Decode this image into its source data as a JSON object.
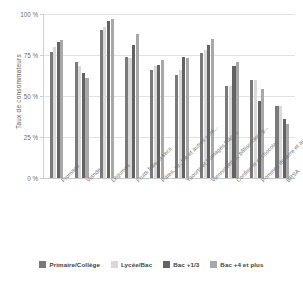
{
  "chart_data": {
    "type": "bar",
    "title": "",
    "xlabel": "",
    "ylabel": "Taux de consommateurs",
    "ylim": [
      0,
      100
    ],
    "ytick_labels": [
      "0 %",
      "25 %",
      "50 %",
      "75 %",
      "100 %"
    ],
    "ytick_values": [
      0,
      25,
      50,
      75,
      100
    ],
    "grid": true,
    "legend_position": "bottom",
    "categories": [
      "Fromage",
      "Viande",
      "Légumes",
      "Fruits frais et secs",
      "Pâtes, riz, blé et autres céré...",
      "Yaourts et fromages blancs",
      "Viennoiseries, pâtisseries, g...",
      "Confiserie et chocolat",
      "Pommes de terre et autres t...",
      "BRSA"
    ],
    "series": [
      {
        "name": "Primaire/Collège",
        "color": "#7a7a7a",
        "values": [
          77,
          71,
          90,
          74,
          66,
          63,
          76,
          56,
          60,
          44
        ]
      },
      {
        "name": "Lycée/Bac",
        "color": "#d9d9d9",
        "values": [
          80,
          68,
          92,
          73,
          68,
          66,
          78,
          56,
          60,
          44
        ]
      },
      {
        "name": "Bac +1/3",
        "color": "#636363",
        "values": [
          83,
          64,
          96,
          81,
          69,
          74,
          81,
          68,
          47,
          36
        ]
      },
      {
        "name": "Bac +4 et plus",
        "color": "#a8a8a8",
        "values": [
          84,
          61,
          97,
          88,
          72,
          73,
          85,
          71,
          54,
          33
        ]
      }
    ]
  },
  "colors": {
    "grid": "#e2e2e2",
    "axis": "#cfcfcf",
    "text": "#6d6d6d",
    "background": "#ffffff"
  }
}
